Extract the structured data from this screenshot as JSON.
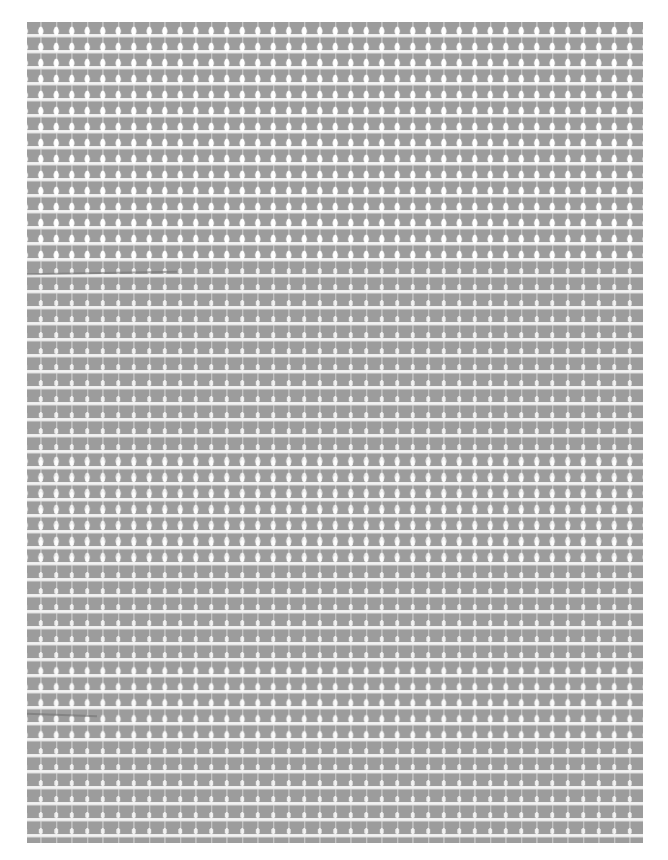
{
  "image": {
    "subject": "woven fabric mesh texture",
    "colors": {
      "background": "#ffffff",
      "fabric": "#9c9c9c",
      "weft_stripe": "#f0f0f0",
      "warp_thread": "#c0c0c0",
      "holes": "#fafafa"
    }
  }
}
